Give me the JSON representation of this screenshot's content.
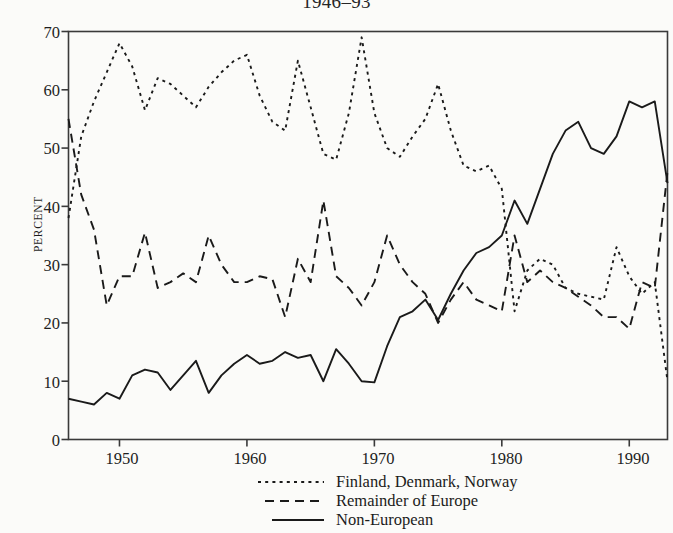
{
  "chart_data": {
    "type": "line",
    "title": "1946–93",
    "xlabel": "",
    "ylabel": "PERCENT",
    "ylim": [
      0,
      70
    ],
    "xlim": [
      1946,
      1993
    ],
    "yticks": [
      0,
      10,
      20,
      30,
      40,
      50,
      60,
      70
    ],
    "xticks": [
      1950,
      1960,
      1970,
      1980,
      1990
    ],
    "grid": false,
    "legend_position": "below-axis-center",
    "x": [
      1946,
      1947,
      1948,
      1949,
      1950,
      1951,
      1952,
      1953,
      1954,
      1955,
      1956,
      1957,
      1958,
      1959,
      1960,
      1961,
      1962,
      1963,
      1964,
      1965,
      1966,
      1967,
      1968,
      1969,
      1970,
      1971,
      1972,
      1973,
      1974,
      1975,
      1976,
      1977,
      1978,
      1979,
      1980,
      1981,
      1982,
      1983,
      1984,
      1985,
      1986,
      1987,
      1988,
      1989,
      1990,
      1991,
      1992,
      1993
    ],
    "series": [
      {
        "name": "Finland, Denmark, Norway",
        "style": "dotted",
        "color": "#1a1a1a",
        "values": [
          38,
          52,
          58,
          63,
          68,
          64,
          56.5,
          62,
          61,
          59,
          57,
          60.5,
          63,
          65,
          66,
          59,
          54.5,
          53,
          65,
          57,
          49,
          48,
          56,
          69,
          56,
          50,
          48.5,
          52,
          55,
          61,
          53,
          47,
          46,
          47,
          43,
          22,
          29,
          31,
          30,
          26,
          25,
          24.5,
          24,
          33,
          28,
          25,
          27,
          10
        ]
      },
      {
        "name": "Remainder of Europe",
        "style": "dashed",
        "color": "#1a1a1a",
        "values": [
          55,
          42,
          36,
          23,
          28,
          28,
          35.5,
          26,
          27,
          28.5,
          27,
          35,
          30,
          27,
          27,
          28,
          27.5,
          21,
          31,
          27,
          41,
          28,
          26,
          23,
          27,
          35,
          30,
          27,
          25,
          20,
          24,
          27,
          24,
          23,
          22,
          35,
          27,
          29,
          27,
          26,
          24.5,
          23,
          21,
          21,
          19,
          27,
          26,
          46
        ]
      },
      {
        "name": "Non-European",
        "style": "solid",
        "color": "#1a1a1a",
        "values": [
          7,
          6.5,
          6,
          8,
          7,
          11,
          12,
          11.5,
          8.5,
          11,
          13.5,
          8,
          11,
          13,
          14.5,
          13,
          13.5,
          15,
          14,
          14.5,
          10,
          15.5,
          13,
          10,
          9.8,
          16,
          21,
          22,
          24,
          20.5,
          25,
          29,
          32,
          33,
          35,
          41,
          37,
          43,
          49,
          53,
          54.5,
          50,
          49,
          52,
          58,
          57,
          58,
          44
        ]
      }
    ]
  },
  "axes": {
    "y_label": "PERCENT",
    "y_ticks": [
      "0",
      "10",
      "20",
      "30",
      "40",
      "50",
      "60",
      "70"
    ],
    "x_ticks": [
      "1950",
      "1960",
      "1970",
      "1980",
      "1990"
    ]
  },
  "legend": {
    "items": [
      {
        "label": "Finland, Denmark, Norway",
        "style": "dotted"
      },
      {
        "label": "Remainder of Europe",
        "style": "dashed"
      },
      {
        "label": "Non-European",
        "style": "solid"
      }
    ]
  },
  "colors": {
    "background": "#fbfbf9",
    "ink": "#1a1a1a",
    "axis": "#3a3a3a"
  }
}
